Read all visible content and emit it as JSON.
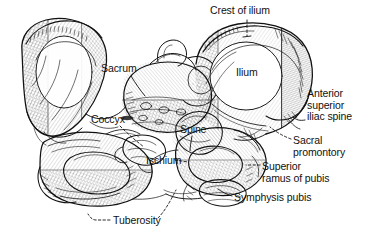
{
  "figure": {
    "style": "pen-and-ink line drawing with cross-hatched shading",
    "background_color": "#ffffff",
    "ink_color": "#111111",
    "width": 365,
    "height": 243
  },
  "labels": [
    {
      "id": "crest-of-ilium",
      "text": "Crest of ilium",
      "x": 210,
      "y": 5,
      "lines": [
        "Crest of ilium"
      ]
    },
    {
      "id": "ilium",
      "text": "Ilium",
      "x": 236,
      "y": 67,
      "lines": [
        "Ilium"
      ]
    },
    {
      "id": "anterior-superior-iliac-spine",
      "text": "Anterior superior iliac spine",
      "x": 307,
      "y": 88,
      "lines": [
        "Anterior",
        "superior",
        "iliac spine"
      ]
    },
    {
      "id": "sacral-promontory",
      "text": "Sacral promontory",
      "x": 293,
      "y": 135,
      "lines": [
        "Sacral",
        "promontory"
      ]
    },
    {
      "id": "superior-ramus-of-pubis",
      "text": "Superior ramus of pubis",
      "x": 262,
      "y": 161,
      "lines": [
        "Superior",
        "ramus of pubis"
      ]
    },
    {
      "id": "symphysis-pubis",
      "text": "Symphysis pubis",
      "x": 234,
      "y": 192,
      "lines": [
        "Symphysis pubis"
      ]
    },
    {
      "id": "sacrum",
      "text": "Sacrum",
      "x": 101,
      "y": 63,
      "lines": [
        "Sacrum"
      ]
    },
    {
      "id": "coccyx",
      "text": "Coccyx",
      "x": 91,
      "y": 114,
      "lines": [
        "Coccyx"
      ]
    },
    {
      "id": "spine",
      "text": "Spine",
      "x": 180,
      "y": 124,
      "lines": [
        "Spine"
      ]
    },
    {
      "id": "ischium",
      "text": "Ischium",
      "x": 146,
      "y": 155,
      "lines": [
        "Ischium"
      ]
    },
    {
      "id": "tuberosity",
      "text": "Tuberosity",
      "x": 113,
      "y": 215,
      "lines": [
        "Tuberosity"
      ]
    }
  ],
  "anatomy_parts": [
    "left iliac wing",
    "right iliac wing",
    "sacrum",
    "coccyx",
    "ischial spine",
    "ischium",
    "ischial tuberosity",
    "superior ramus of pubis",
    "symphysis pubis",
    "obturator foramen (left)",
    "obturator foramen (right)",
    "sacral promontory",
    "anterior superior iliac spine",
    "iliac crest"
  ],
  "leaders": [
    {
      "id": "leader-crest-of-ilium",
      "style": "dashed",
      "from": "crest-of-ilium label",
      "to": "superior border of right ilium"
    },
    {
      "id": "leader-anterior-superior-iliac-spine",
      "style": "solid-hook",
      "from": "anterior superior iliac spine label",
      "to": "anterior projection of right ilium"
    },
    {
      "id": "leader-sacral-promontory",
      "style": "dashed",
      "from": "sacral promontory label",
      "to": "superior anterior sacrum"
    },
    {
      "id": "leader-superior-ramus-of-pubis",
      "style": "dashed",
      "from": "superior ramus of pubis label",
      "to": "pubic ramus"
    },
    {
      "id": "leader-symphysis-pubis",
      "style": "solid",
      "from": "symphysis pubis label",
      "to": "pubic symphysis joint"
    },
    {
      "id": "leader-sacrum",
      "style": "solid",
      "from": "sacrum label",
      "to": "sacral body"
    },
    {
      "id": "leader-coccyx",
      "style": "dashed",
      "from": "coccyx label",
      "to": "coccyx tip"
    },
    {
      "id": "leader-spine",
      "style": "solid",
      "from": "spine label",
      "to": "ischial spine"
    },
    {
      "id": "leader-ischium",
      "style": "dashed",
      "from": "ischium label",
      "to": "ischial body"
    },
    {
      "id": "leader-tuberosity-left",
      "style": "dashed",
      "from": "tuberosity label",
      "to": "left ischial tuberosity"
    },
    {
      "id": "leader-tuberosity-right",
      "style": "dashed",
      "from": "tuberosity label",
      "to": "right ischial tuberosity"
    }
  ]
}
